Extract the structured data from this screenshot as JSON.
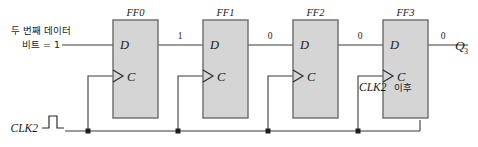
{
  "diagram": {
    "type": "shift-register-timing-state",
    "title_visible": false,
    "colors": {
      "box_fill": "#d5d5d5",
      "box_stroke": "#6b6b6b",
      "wire": "#3a3a3a",
      "text": "#1a1a1a"
    },
    "input_annotation": {
      "line1": "두 번째 데이터",
      "line2": "비트 = 1"
    },
    "flipflops": [
      {
        "label": "FF0",
        "d_pin": "D",
        "c_pin": "C"
      },
      {
        "label": "FF1",
        "d_pin": "D",
        "c_pin": "C"
      },
      {
        "label": "FF2",
        "d_pin": "D",
        "c_pin": "C"
      },
      {
        "label": "FF3",
        "d_pin": "D",
        "c_pin": "C"
      }
    ],
    "wire_values": [
      {
        "name": "ff0-to-ff1",
        "value": "1"
      },
      {
        "name": "ff1-to-ff2",
        "value": "0"
      },
      {
        "name": "ff2-to-ff3",
        "value": "0"
      },
      {
        "name": "ff3-output",
        "value": "0"
      }
    ],
    "output_label": {
      "base": "Q",
      "subscript": "3"
    },
    "clock": {
      "label": "CLK2",
      "waveform": "single-positive-pulse"
    },
    "note": {
      "text_italic": "CLK2",
      "text_korean": " 이후"
    }
  }
}
